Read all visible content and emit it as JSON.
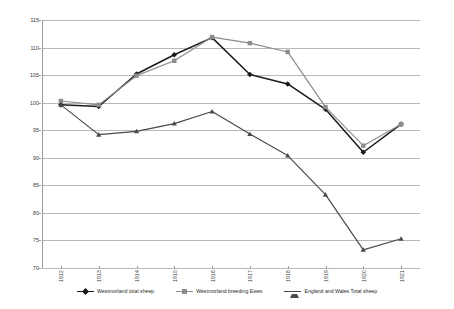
{
  "chart_data": {
    "type": "line",
    "title": "",
    "subtitle": "",
    "xlabel": "",
    "ylabel": "",
    "grid": true,
    "legend_position": "bottom",
    "ylim": [
      70,
      115
    ],
    "yticks": [
      70,
      75,
      80,
      85,
      90,
      95,
      100,
      105,
      110,
      115
    ],
    "categories": [
      "1912",
      "1913",
      "1914",
      "1915",
      "1916",
      "1917",
      "1918",
      "1919",
      "1920",
      "1921"
    ],
    "series": [
      {
        "name": "Westmorland total sheep",
        "color": "#1a1a1a",
        "marker": "diamond",
        "values": [
          99.6,
          99.3,
          105.2,
          108.7,
          111.8,
          105.1,
          103.4,
          98.8,
          91.0,
          96.1
        ]
      },
      {
        "name": "Westmorland breeding Ewes",
        "color": "#8c8c8c",
        "marker": "square",
        "values": [
          100.3,
          99.6,
          104.9,
          107.6,
          111.9,
          110.8,
          109.2,
          99.2,
          92.2,
          96.1
        ]
      },
      {
        "name": "England and Wales Total sheep",
        "color": "#4a4a4a",
        "marker": "triangle",
        "values": [
          99.6,
          94.2,
          94.8,
          96.2,
          98.4,
          94.3,
          90.4,
          83.3,
          73.3,
          75.3
        ]
      }
    ]
  },
  "axes": {
    "y_tick_labels": [
      "115",
      "110",
      "105",
      "100",
      "95",
      "90",
      "85",
      "80",
      "75",
      "70"
    ],
    "x_tick_labels": [
      "1912",
      "1913",
      "1914",
      "1915",
      "1916",
      "1917",
      "1918",
      "1919",
      "1920",
      "1921"
    ]
  },
  "legend": {
    "items": [
      {
        "label": "Westmorland total sheep",
        "color": "#1a1a1a",
        "marker": "diamond"
      },
      {
        "label": "Westmorland breeding Ewes",
        "color": "#8c8c8c",
        "marker": "square"
      },
      {
        "label": "England and Wales Total sheep",
        "color": "#4a4a4a",
        "marker": "triangle"
      }
    ]
  },
  "colors": {
    "gridline": "#b8b8b8",
    "axis": "#9a9a9a",
    "background": "#ffffff",
    "text": "#3a3a3a"
  }
}
